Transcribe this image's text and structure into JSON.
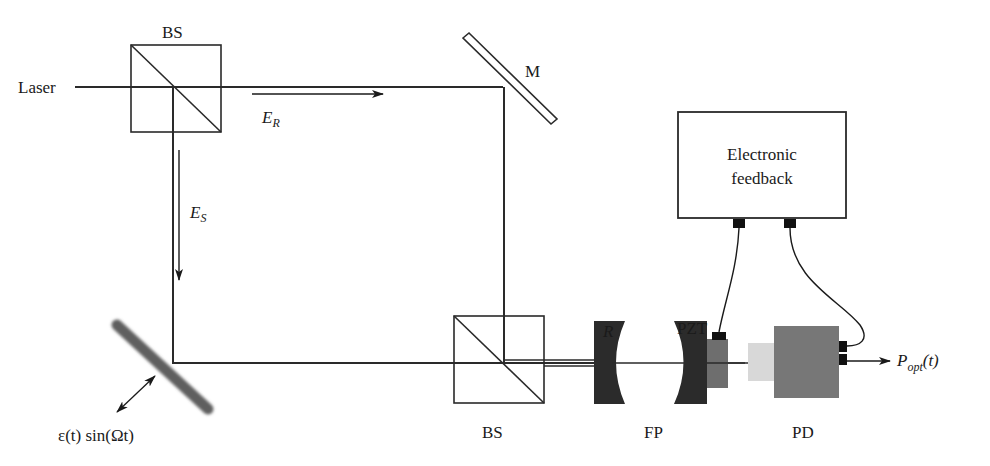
{
  "diagram": {
    "labels": {
      "laser": "Laser",
      "bs_top": "BS",
      "bs_bottom": "BS",
      "mirror": "M",
      "reference_field": "E",
      "reference_sub": "R",
      "signal_field": "E",
      "signal_sub": "S",
      "modulation": "ε(t) sin(Ωt)",
      "cavity_mirror": "R",
      "pzt": "PZT",
      "fabry_perot": "FP",
      "photodetector": "PD",
      "feedback_line1": "Electronic",
      "feedback_line2": "feedback",
      "output_main": "P",
      "output_sub": "opt",
      "output_arg": "(t)"
    },
    "colors": {
      "line": "#2a2a2a",
      "mirror_dark": "#2b2b2b",
      "pzt": "#6e6e6e",
      "pd_body": "#777777",
      "pd_window": "#d8d8d8",
      "connector": "#111111",
      "vibrating_mirror": "#6a6a6a"
    }
  }
}
